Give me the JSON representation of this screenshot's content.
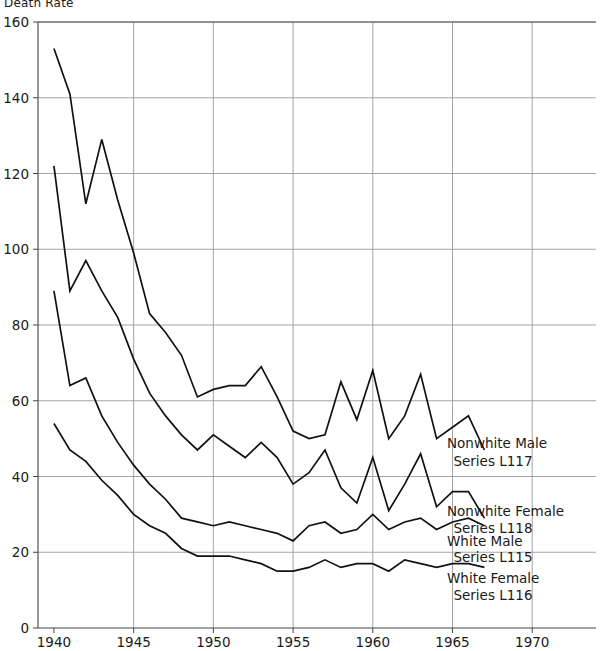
{
  "figure": {
    "axis_label_top": "Death Rate",
    "background": "#ffffff",
    "line_color": "#111111",
    "grid_color": "#9a9a9a",
    "axis_color": "#444444"
  },
  "chart_data": {
    "type": "line",
    "title": "",
    "subtitle": "",
    "xlabel": "",
    "ylabel": "Death Rate",
    "xlim": [
      1939,
      1974
    ],
    "ylim": [
      0,
      160
    ],
    "grid": true,
    "legend_position": "inline-right",
    "xticks": [
      1940,
      1945,
      1950,
      1955,
      1960,
      1965,
      1970
    ],
    "xtick_labels": [
      "1940",
      "1945",
      "1950",
      "1955",
      "1960",
      "1965",
      "1970"
    ],
    "yticks": [
      0,
      20,
      40,
      60,
      80,
      100,
      120,
      140,
      160
    ],
    "ytick_labels": [
      "0",
      "20",
      "40",
      "60",
      "80",
      "100",
      "120",
      "140",
      "160"
    ],
    "x": [
      1940,
      1941,
      1942,
      1943,
      1944,
      1945,
      1946,
      1947,
      1948,
      1949,
      1950,
      1951,
      1952,
      1953,
      1954,
      1955,
      1956,
      1957,
      1958,
      1959,
      1960,
      1961,
      1962,
      1963,
      1964,
      1965,
      1966,
      1967
    ],
    "series": [
      {
        "name": "Nonwhite Male",
        "code": "Series L117",
        "label_lines": [
          "Nonwhite Male",
          "Series L117"
        ],
        "values": [
          153,
          141,
          112,
          129,
          113,
          99,
          83,
          78,
          72,
          61,
          63,
          64,
          64,
          69,
          61,
          52,
          50,
          51,
          65,
          55,
          68,
          50,
          56,
          67,
          50,
          53,
          56,
          47
        ]
      },
      {
        "name": "Nonwhite Female",
        "code": "Series L118",
        "label_lines": [
          "Nonwhite Female",
          "Series L118"
        ],
        "values": [
          122,
          89,
          97,
          89,
          82,
          71,
          62,
          56,
          51,
          47,
          51,
          48,
          45,
          49,
          45,
          38,
          41,
          47,
          37,
          33,
          45,
          31,
          38,
          46,
          32,
          36,
          36,
          29
        ]
      },
      {
        "name": "White Male",
        "code": "Series L115",
        "label_lines": [
          "White Male",
          "Series L115"
        ],
        "values": [
          89,
          64,
          66,
          56,
          49,
          43,
          38,
          34,
          29,
          28,
          27,
          28,
          27,
          26,
          25,
          23,
          27,
          28,
          25,
          26,
          30,
          26,
          28,
          29,
          26,
          28,
          29,
          27
        ]
      },
      {
        "name": "White Female",
        "code": "Series L116",
        "label_lines": [
          "White Female",
          "Series L116"
        ],
        "values": [
          54,
          47,
          44,
          39,
          35,
          30,
          27,
          25,
          21,
          19,
          19,
          19,
          18,
          17,
          15,
          15,
          16,
          18,
          16,
          17,
          17,
          15,
          18,
          17,
          16,
          17,
          17,
          16
        ]
      }
    ],
    "annotations": [
      {
        "series": "Nonwhite Male",
        "x": 1967,
        "text": "Nonwhite Male Series L117"
      },
      {
        "series": "Nonwhite Female",
        "x": 1967,
        "text": "Nonwhite Female Series L118"
      },
      {
        "series": "White Male",
        "x": 1967,
        "text": "White Male Series L115"
      },
      {
        "series": "White Female",
        "x": 1967,
        "text": "White Female Series L116"
      }
    ]
  }
}
